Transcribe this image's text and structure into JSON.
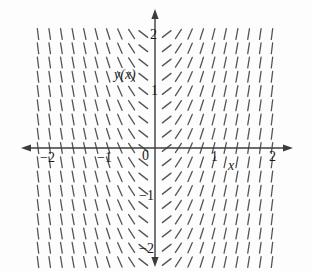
{
  "chart_data": {
    "type": "line",
    "title": "",
    "subtitle": "",
    "xlabel": "x",
    "ylabel": "y(x)",
    "xlim": [
      -2.15,
      2.15
    ],
    "ylim": [
      -2.15,
      2.15
    ],
    "grid": false,
    "legend": null,
    "annotations": [
      {
        "text": "y(x)",
        "x": -0.6,
        "y": 1.45,
        "style": "italic"
      },
      {
        "text": "x",
        "x": 1.25,
        "y": -0.25,
        "style": "italic"
      }
    ],
    "xticks": [
      -2,
      -1,
      0,
      1,
      2
    ],
    "xtick_labels": [
      "−2",
      "−1",
      "0",
      "1",
      "2"
    ],
    "yticks": [
      -2,
      -1,
      1,
      2
    ],
    "ytick_labels": [
      "−2",
      "−1",
      "1",
      "2"
    ],
    "slope_field": {
      "equation_form": "dy/dx = k*x",
      "k": 4.0,
      "x_samples": [
        -2.0,
        -1.8,
        -1.6,
        -1.4,
        -1.2,
        -1.0,
        -0.8,
        -0.6,
        -0.4,
        -0.2,
        0.2,
        0.4,
        0.6,
        0.8,
        1.0,
        1.2,
        1.4,
        1.6,
        1.8,
        2.0
      ],
      "y_samples": [
        -2.0,
        -1.75,
        -1.5,
        -1.25,
        -1.0,
        -0.75,
        -0.5,
        -0.25,
        0.0,
        0.25,
        0.5,
        0.75,
        1.0,
        1.25,
        1.5,
        1.75,
        2.0
      ],
      "segment_length_px": 11,
      "stroke": "#555555",
      "stroke_width": 1.3
    }
  },
  "axes": {
    "axis_color": "#3c3c3c",
    "x_axis_name": "horizontal-axis",
    "y_axis_name": "vertical-axis",
    "arrow_heads": [
      "left",
      "right",
      "up",
      "down"
    ]
  },
  "labels": {
    "x_neg2": "−2",
    "x_neg1": "−1",
    "origin": "0",
    "x_pos1": "1",
    "x_pos2": "2",
    "y_pos2": "2",
    "y_pos1": "1",
    "y_neg1": "−1",
    "y_neg2": "−2",
    "y_of_x": "y(x)",
    "x_var": "x"
  },
  "colors": {
    "background": "#fdfdfd",
    "ink": "#1a1a1a",
    "segment": "#555555",
    "axis": "#3c3c3c"
  }
}
